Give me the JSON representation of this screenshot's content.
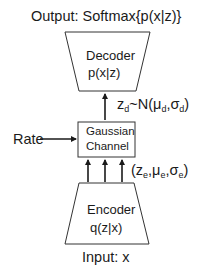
{
  "diagram": {
    "output_label": "Output: Softmax{p(x|z)}",
    "decoder": {
      "title": "Decoder",
      "formula": "p(x|z)"
    },
    "decoder_arrow_label": {
      "prefix": "z",
      "sub1": "d",
      "mid": "~N(μ",
      "sub2": "d",
      "comma": ",σ",
      "sub3": "d",
      "close": ")"
    },
    "channel": {
      "line1": "Gaussian",
      "line2": "Channel"
    },
    "rate_label": "Rate",
    "encoder_arrow_label": {
      "open": "(z",
      "sub1": "e",
      "mu": ",μ",
      "sub2": "e",
      "sigma": ",σ",
      "sub3": "e",
      "close": ")"
    },
    "encoder": {
      "title": "Encoder",
      "formula": "q(z|x)"
    },
    "input_label": "Input: x",
    "colors": {
      "stroke": "#333333",
      "text": "#1a1a1a",
      "background": "#ffffff"
    }
  }
}
